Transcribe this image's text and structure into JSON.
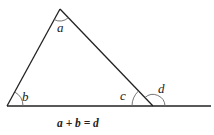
{
  "diagram": {
    "type": "exterior-angle-theorem",
    "labels": {
      "a": "a",
      "b": "b",
      "c": "c",
      "d": "d"
    },
    "equation": "a + b = d",
    "colors": {
      "line": "#222222",
      "arc": "#555555",
      "background": "#ffffff"
    }
  }
}
